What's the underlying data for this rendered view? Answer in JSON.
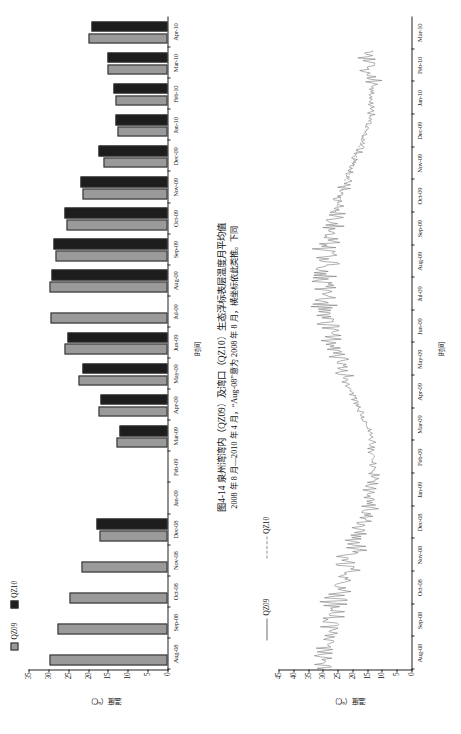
{
  "figure": {
    "caption_line1": "图4-14  泉州湾湾内（QZ09）及湾口（QZ10）生态浮标表层温度月平均值",
    "caption_line2": "2008 年 8 月—2010 年 4 月，“Aug-08”意为 2008 年 8 月，横坐标依此类推。下同"
  },
  "bar_chart": {
    "legend": [
      {
        "label": "QZ09",
        "color": "#9a9a9a",
        "marker": "filled-square"
      },
      {
        "label": "QZ10",
        "color": "#1d1d1d",
        "marker": "filled-square"
      }
    ],
    "xlabel": "时间",
    "ylabel": "温度（℃）"
  },
  "line_chart": {
    "legend": [
      {
        "label": "QZ09",
        "color": "#6f6f6f",
        "marker": "solid-line"
      },
      {
        "label": "QZ10",
        "color": "#8d8d8d",
        "marker": "dashed-line"
      }
    ],
    "xlabel": "时间",
    "ylabel": "温度（℃）"
  },
  "chart_data": [
    {
      "type": "bar",
      "id": "monthly-mean-surface-temperature",
      "title": "图4-14  泉州湾湾内（QZ09）及湾口（QZ10）生态浮标表层温度月平均值",
      "xlabel": "时间",
      "ylabel": "温度（℃）",
      "ylim": [
        0,
        35
      ],
      "yticks": [
        0,
        5,
        10,
        15,
        20,
        25,
        30,
        35
      ],
      "grid": false,
      "legend_position": "top-left",
      "categories": [
        "Aug-08",
        "Sep-08",
        "Oct-08",
        "Nov-08",
        "Dec-08",
        "Jan-09",
        "Feb-09",
        "Mar-09",
        "Apr-09",
        "May-09",
        "Jun-09",
        "Jul-09",
        "Aug-09",
        "Sep-09",
        "Oct-09",
        "Nov-09",
        "Dec-09",
        "Jan-10",
        "Feb-10",
        "Mar-10",
        "Apr-10"
      ],
      "series": [
        {
          "name": "QZ09",
          "color": "#9a9a9a",
          "values": [
            29.8,
            27.6,
            24.7,
            21.6,
            17.2,
            null,
            null,
            12.9,
            17.3,
            22.4,
            25.9,
            29.4,
            29.6,
            28.2,
            25.4,
            21.5,
            16.0,
            12.7,
            13.1,
            15.1,
            19.8
          ]
        },
        {
          "name": "QZ10",
          "color": "#1d1d1d",
          "values": [
            null,
            null,
            null,
            null,
            17.8,
            null,
            null,
            12.2,
            16.9,
            21.4,
            25.3,
            null,
            29.2,
            28.6,
            25.9,
            21.8,
            17.4,
            13.2,
            13.5,
            15.0,
            19.2
          ]
        }
      ]
    },
    {
      "type": "line",
      "id": "high-frequency-surface-temperature",
      "xlabel": "时间",
      "ylabel": "温度（℃）",
      "ylim": [
        0,
        45
      ],
      "yticks": [
        0,
        5,
        10,
        15,
        20,
        25,
        30,
        35,
        40,
        45
      ],
      "grid": false,
      "legend_position": "top-left",
      "x": [
        "Aug-08",
        "Sep-08",
        "Oct-08",
        "Nov-08",
        "Dec-08",
        "Jan-09",
        "Feb-09",
        "Mar-09",
        "Apr-09",
        "May-09",
        "Jun-09",
        "Jul-09",
        "Aug-09",
        "Sep-09",
        "Oct-09",
        "Nov-09",
        "Dec-09",
        "Jan-10",
        "Feb-10",
        "Mar-10"
      ],
      "series": [
        {
          "name": "QZ09",
          "color": "#6f6f6f",
          "style": "solid",
          "note": "连续高频观测，振幅约 ±4℃",
          "values": [
            30.1,
            28.9,
            26.0,
            22.3,
            18.4,
            14.6,
            13.0,
            13.4,
            17.4,
            22.6,
            26.2,
            29.2,
            29.9,
            28.4,
            25.6,
            21.9,
            17.2,
            13.6,
            13.2,
            15.4
          ]
        },
        {
          "name": "QZ10",
          "color": "#8d8d8d",
          "style": "dashed",
          "note": "仅 2009 年 10 月—2010 年 1 月有数据段",
          "values": [
            null,
            null,
            null,
            null,
            null,
            null,
            null,
            null,
            null,
            null,
            null,
            null,
            null,
            null,
            25.9,
            22.0,
            17.6,
            13.9,
            null,
            null
          ]
        }
      ]
    }
  ]
}
